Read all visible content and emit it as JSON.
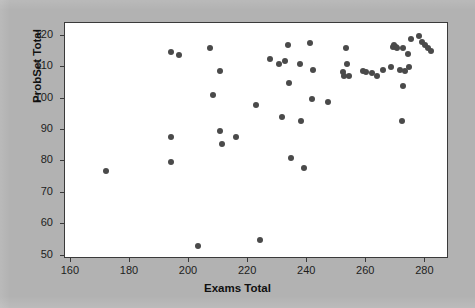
{
  "chart_data": {
    "type": "scatter",
    "title": "",
    "xlabel": "Exams Total",
    "ylabel": "ProbSet Total",
    "xlim": [
      158,
      288
    ],
    "ylim": [
      49,
      124
    ],
    "xticks": [
      160,
      180,
      200,
      220,
      240,
      260,
      280
    ],
    "yticks": [
      50,
      60,
      70,
      80,
      90,
      100,
      110,
      120
    ],
    "grid": false,
    "legend": null,
    "marker": {
      "shape": "circle",
      "color": "#4a4a4a",
      "size_px": 6
    },
    "background_color": "#b2b2b2",
    "plot_background_color": "#ffffff",
    "frame_color": "#3a3a3a",
    "n_points": 56,
    "points": [
      [
        172,
        77
      ],
      [
        194,
        114.7
      ],
      [
        194,
        87.7
      ],
      [
        194,
        79.8
      ],
      [
        196.5,
        113.8
      ],
      [
        203,
        53
      ],
      [
        207,
        116
      ],
      [
        208,
        101
      ],
      [
        210.5,
        108.8
      ],
      [
        210.5,
        89.8
      ],
      [
        211,
        85.7
      ],
      [
        216,
        87.7
      ],
      [
        222.5,
        98
      ],
      [
        224,
        55
      ],
      [
        227.5,
        112.5
      ],
      [
        230.5,
        111
      ],
      [
        231.5,
        94
      ],
      [
        232.5,
        111.8
      ],
      [
        233.5,
        117
      ],
      [
        234,
        105
      ],
      [
        234.5,
        81
      ],
      [
        237.5,
        111
      ],
      [
        238,
        93
      ],
      [
        239,
        78
      ],
      [
        241,
        117.7
      ],
      [
        241.5,
        100
      ],
      [
        242,
        109
      ],
      [
        247,
        99
      ],
      [
        252,
        108.5
      ],
      [
        252.5,
        107.2
      ],
      [
        253,
        116
      ],
      [
        253.5,
        111
      ],
      [
        254,
        107
      ],
      [
        259,
        108.8
      ],
      [
        260,
        108.5
      ],
      [
        262,
        108
      ],
      [
        263.5,
        107
      ],
      [
        265.5,
        109
      ],
      [
        268.5,
        110
      ],
      [
        269,
        116.5
      ],
      [
        269.5,
        117
      ],
      [
        270,
        116.3
      ],
      [
        270.5,
        116
      ],
      [
        271.5,
        109
      ],
      [
        272,
        93
      ],
      [
        272.5,
        116
      ],
      [
        272.5,
        104
      ],
      [
        273,
        108.8
      ],
      [
        274,
        114
      ],
      [
        274.5,
        110
      ],
      [
        275,
        119
      ],
      [
        278,
        120
      ],
      [
        279,
        118
      ],
      [
        280,
        117
      ],
      [
        281,
        116
      ],
      [
        282,
        115
      ]
    ]
  },
  "axes": {
    "y_title": "ProbSet Total",
    "x_title": "Exams Total",
    "y_tick_labels": [
      "120",
      "110",
      "100",
      "90",
      "80",
      "70",
      "60",
      "50"
    ],
    "x_tick_labels": [
      "160",
      "180",
      "200",
      "220",
      "240",
      "260",
      "280"
    ]
  }
}
